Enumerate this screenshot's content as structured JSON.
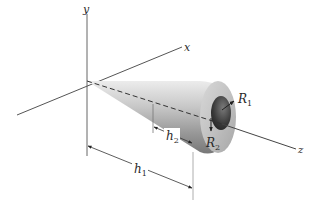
{
  "figure": {
    "axes": {
      "x_label": "x",
      "y_label": "y",
      "z_label": "z"
    },
    "dimensions": {
      "h1": {
        "base": "h",
        "sub": "1"
      },
      "h2": {
        "base": "h",
        "sub": "2"
      },
      "R1": {
        "base": "R",
        "sub": "1"
      },
      "R2": {
        "base": "R",
        "sub": "2"
      }
    },
    "colors": {
      "axis": "#555555",
      "cone_light": "#e6e6e6",
      "cone_mid": "#b4b4b4",
      "cone_dark": "#6e6e6e",
      "hole": "#2a2a2a"
    }
  }
}
